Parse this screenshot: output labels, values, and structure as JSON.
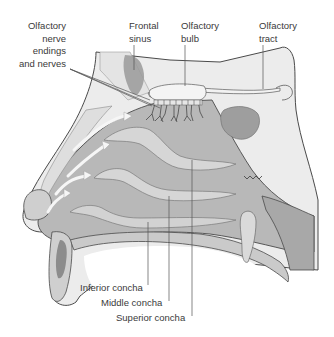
{
  "diagram": {
    "colors": {
      "background": "#ffffff",
      "tissue_dark": "#8a8a8a",
      "tissue_mid": "#b4b4b4",
      "tissue_light": "#d0d0d0",
      "bone_pale": "#ececec",
      "outline": "#4a4a4a",
      "leader_line": "#555555",
      "label_text": "#3a3a3a",
      "airflow_arrow": "#f4f4f4"
    },
    "labels": [
      {
        "id": "olfactory-nerve-endings",
        "text": "Olfactory\nnerve\nendings\nand nerves",
        "x": 66,
        "y": 20,
        "align": "right"
      },
      {
        "id": "frontal-sinus",
        "text": "Frontal\nsinus",
        "x": 129,
        "y": 20,
        "align": "left"
      },
      {
        "id": "olfactory-bulb",
        "text": "Olfactory\nbulb",
        "x": 181,
        "y": 20,
        "align": "left"
      },
      {
        "id": "olfactory-tract",
        "text": "Olfactory\ntract",
        "x": 259,
        "y": 20,
        "align": "left"
      },
      {
        "id": "inferior-concha",
        "text": "Inferior concha",
        "x": 80,
        "y": 285,
        "align": "left"
      },
      {
        "id": "middle-concha",
        "text": "Middle concha",
        "x": 101,
        "y": 301,
        "align": "left"
      },
      {
        "id": "superior-concha",
        "text": "Superior concha",
        "x": 116,
        "y": 316,
        "align": "left"
      }
    ],
    "airflow_arrows": 4
  }
}
